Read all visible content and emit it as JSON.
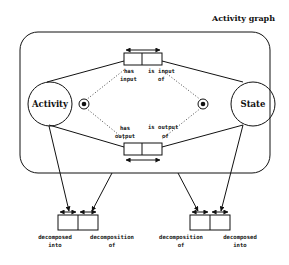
{
  "diagram": {
    "title": "Activity graph",
    "nodes": {
      "activity": {
        "label": "Activity"
      },
      "state": {
        "label": "State"
      }
    },
    "relations": {
      "input": {
        "left_role": [
          "has",
          "input"
        ],
        "right_role": [
          "is input",
          "of"
        ]
      },
      "output": {
        "left_role": [
          "has",
          "output"
        ],
        "right_role": [
          "is output",
          "of"
        ]
      },
      "decomp_left": {
        "left_role": [
          "decomposed",
          "into"
        ],
        "right_role": [
          "decomposition",
          "of"
        ]
      },
      "decomp_right": {
        "left_role": [
          "decomposition",
          "of"
        ],
        "right_role": [
          "decomposed",
          "into"
        ]
      }
    },
    "markers": [
      "object-marker-left",
      "object-marker-right"
    ],
    "colors": {
      "ink": "#111111",
      "background": "#ffffff"
    }
  }
}
